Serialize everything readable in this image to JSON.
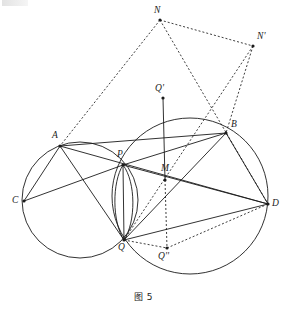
{
  "figure": {
    "caption": "图 5",
    "caption_x": 143,
    "caption_y": 290,
    "width": 287,
    "height": 313,
    "stroke_color": "#1b1b1b",
    "background": "#ffffff"
  },
  "points": [
    {
      "id": "A",
      "label": "A",
      "x": 60,
      "y": 146,
      "lx": 52,
      "ly": 131,
      "dot": true
    },
    {
      "id": "B",
      "label": "B",
      "x": 226,
      "y": 133,
      "lx": 231,
      "ly": 120,
      "dot": true
    },
    {
      "id": "C",
      "label": "C",
      "x": 24,
      "y": 201,
      "lx": 12,
      "ly": 196,
      "dot": true
    },
    {
      "id": "D",
      "label": "D",
      "x": 268,
      "y": 204,
      "lx": 272,
      "ly": 199,
      "dot": true
    },
    {
      "id": "P",
      "label": "P",
      "x": 123,
      "y": 165,
      "lx": 117,
      "ly": 150,
      "dot": true
    },
    {
      "id": "Q",
      "label": "Q",
      "x": 124,
      "y": 240,
      "lx": 118,
      "ly": 243,
      "dot": true
    },
    {
      "id": "M",
      "label": "M",
      "x": 165,
      "y": 180,
      "lx": 161,
      "ly": 164,
      "dot": true
    },
    {
      "id": "Qp",
      "label": "Q'",
      "x": 163,
      "y": 98,
      "lx": 155,
      "ly": 84,
      "dot": true
    },
    {
      "id": "Qpp",
      "label": "Q''",
      "x": 167,
      "y": 248,
      "lx": 158,
      "ly": 252,
      "dot": true
    },
    {
      "id": "N",
      "label": "N",
      "x": 160,
      "y": 20,
      "lx": 154,
      "ly": 6,
      "dot": true
    },
    {
      "id": "Np",
      "label": "N'",
      "x": 253,
      "y": 46,
      "lx": 257,
      "ly": 32,
      "dot": true
    }
  ],
  "circles": [
    {
      "name": "left-circle",
      "cx": 80,
      "cy": 200,
      "r": 58
    },
    {
      "name": "right-circle",
      "cx": 190,
      "cy": 196,
      "r": 78
    },
    {
      "name": "lens-arc-left",
      "path": "M 123 165 C 112 182 112 222 124 240"
    },
    {
      "name": "lens-arc-right",
      "path": "M 123 165 C 136 182 136 222 124 240"
    }
  ],
  "solid_segments": [
    {
      "name": "segment-A-B",
      "from": "A",
      "to": "B"
    },
    {
      "name": "segment-A-C",
      "from": "A",
      "to": "C"
    },
    {
      "name": "segment-A-D",
      "from": "A",
      "to": "D"
    },
    {
      "name": "segment-A-Q",
      "from": "A",
      "to": "Q"
    },
    {
      "name": "segment-C-P",
      "from": "C",
      "to": "P"
    },
    {
      "name": "segment-P-B",
      "from": "P",
      "to": "B"
    },
    {
      "name": "segment-P-D",
      "from": "P",
      "to": "D"
    },
    {
      "name": "segment-P-Q",
      "from": "P",
      "to": "Q"
    },
    {
      "name": "segment-Q-B",
      "from": "Q",
      "to": "B"
    },
    {
      "name": "segment-Q-D",
      "from": "Q",
      "to": "D"
    },
    {
      "name": "segment-B-D",
      "from": "B",
      "to": "D"
    },
    {
      "name": "segment-Qprime-M",
      "from": "Qp",
      "to": "M"
    }
  ],
  "dashed_segments": [
    {
      "name": "segment-N-A",
      "from": "N",
      "to": "A"
    },
    {
      "name": "segment-N-Nprime",
      "from": "N",
      "to": "Np"
    },
    {
      "name": "segment-N-D",
      "from": "N",
      "to": "D"
    },
    {
      "name": "segment-Nprime-B",
      "from": "Np",
      "to": "B"
    },
    {
      "name": "segment-Nprime-Q",
      "from": "Np",
      "to": "Q"
    },
    {
      "name": "segment-M-Qdoubleprime",
      "from": "M",
      "to": "Qpp"
    },
    {
      "name": "segment-Q-Qdoubleprime",
      "from": "Q",
      "to": "Qpp"
    },
    {
      "name": "segment-Qdoubleprime-D",
      "from": "Qpp",
      "to": "D"
    }
  ]
}
